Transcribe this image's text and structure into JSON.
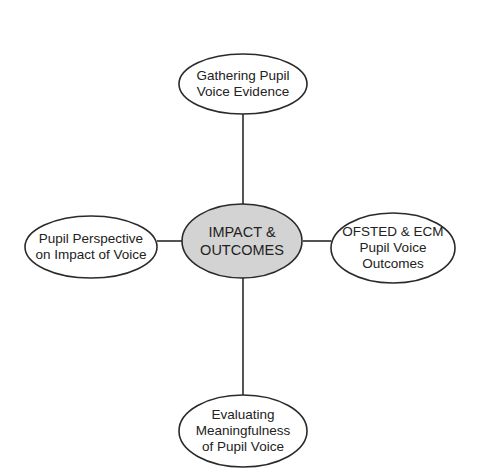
{
  "diagram": {
    "type": "mind-map",
    "colors": {
      "stroke": "#2a2a2a",
      "center_fill": "#d3d3d3",
      "node_fill": "#ffffff",
      "background": "#ffffff"
    },
    "center": {
      "label": "IMPACT &\nOUTCOMES"
    },
    "nodes": [
      {
        "id": "top",
        "label": "Gathering Pupil\nVoice Evidence"
      },
      {
        "id": "right",
        "label": "OFSTED & ECM\nPupil Voice\nOutcomes"
      },
      {
        "id": "bottom",
        "label": "Evaluating\nMeaningfulness\nof Pupil Voice"
      },
      {
        "id": "left",
        "label": "Pupil Perspective\non Impact of Voice"
      }
    ],
    "edges": [
      {
        "from": "center",
        "to": "top"
      },
      {
        "from": "center",
        "to": "right"
      },
      {
        "from": "center",
        "to": "bottom"
      },
      {
        "from": "center",
        "to": "left"
      }
    ]
  }
}
